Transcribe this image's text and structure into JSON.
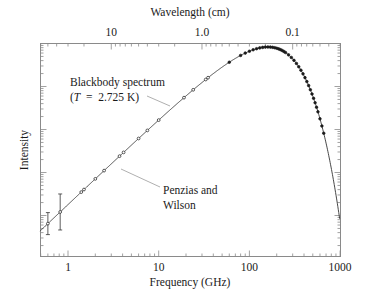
{
  "chart_data": {
    "type": "line",
    "title": "",
    "xlabel": "Frequency (GHz)",
    "ylabel": "Intensity",
    "x2label": "Wavelength (cm)",
    "xscale": "log",
    "yscale": "log",
    "xlim": [
      0.49,
      1000
    ],
    "x_ticks": [
      {
        "value": 1,
        "label": "1"
      },
      {
        "value": 10,
        "label": "10"
      },
      {
        "value": 100,
        "label": "100"
      },
      {
        "value": 1000,
        "label": "1000"
      }
    ],
    "x2_ticks": [
      {
        "value_cm": 10,
        "label": "10"
      },
      {
        "value_cm": 1.0,
        "label": "1.0"
      },
      {
        "value_cm": 0.1,
        "label": "0.1"
      }
    ],
    "y_tick_labels": [],
    "grid": false,
    "legend": null,
    "series": [
      {
        "name": "Blackbody spectrum (T = 2.725 K)",
        "kind": "curve",
        "temperature_K": 2.725
      },
      {
        "name": "Measurements",
        "kind": "points",
        "points": [
          {
            "x": 0.6,
            "err": true
          },
          {
            "x": 0.82,
            "err": true
          },
          {
            "x": 1.4
          },
          {
            "x": 1.5
          },
          {
            "x": 2.0
          },
          {
            "x": 2.5
          },
          {
            "x": 3.7
          },
          {
            "x": 4.1
          },
          {
            "x": 6.0
          },
          {
            "x": 7.5
          },
          {
            "x": 10.0
          },
          {
            "x": 19.0
          },
          {
            "x": 24.0
          },
          {
            "x": 33.0
          },
          {
            "x": 35.0
          },
          {
            "x": 60.0
          },
          {
            "x": 80.0
          },
          {
            "x": 90.0
          },
          {
            "x": 100.0
          },
          {
            "x": 110.0
          },
          {
            "x": 120.0
          },
          {
            "x": 130.0
          },
          {
            "x": 140.0
          },
          {
            "x": 150.0
          },
          {
            "x": 160.0
          },
          {
            "x": 170.0
          },
          {
            "x": 180.0
          },
          {
            "x": 190.0
          },
          {
            "x": 200.0
          },
          {
            "x": 210.0
          },
          {
            "x": 220.0
          },
          {
            "x": 230.0
          },
          {
            "x": 240.0
          },
          {
            "x": 250.0
          },
          {
            "x": 270.0
          },
          {
            "x": 290.0
          },
          {
            "x": 310.0
          },
          {
            "x": 330.0
          },
          {
            "x": 350.0
          },
          {
            "x": 370.0
          },
          {
            "x": 390.0
          },
          {
            "x": 410.0
          },
          {
            "x": 430.0
          },
          {
            "x": 450.0
          },
          {
            "x": 470.0
          },
          {
            "x": 490.0
          },
          {
            "x": 510.0
          },
          {
            "x": 530.0
          },
          {
            "x": 550.0
          },
          {
            "x": 570.0
          },
          {
            "x": 600.0
          },
          {
            "x": 630.0
          },
          {
            "x": 660.0
          }
        ]
      }
    ],
    "annotations": [
      {
        "text_line1": "Blackbody spectrum",
        "text_line2": "(T  =  2.725 K)",
        "points_to_GHz": 22
      },
      {
        "text_line1": "Penzias and",
        "text_line2": "Wilson",
        "points_to_GHz": 4.1
      }
    ]
  },
  "labels": {
    "top_axis_title": "Wavelength (cm)",
    "bottom_axis_title": "Frequency (GHz)",
    "left_axis_title": "Intensity",
    "annotation_blackbody_line1": "Blackbody spectrum",
    "annotation_blackbody_T": "T",
    "annotation_blackbody_line2_rest": "  =  2.725 K)",
    "annotation_blackbody_open": "(",
    "annotation_pw_line1": "Penzias and",
    "annotation_pw_line2": "Wilson"
  },
  "colors": {
    "axis": "#8a8a8a",
    "curve": "#333333",
    "points": "#1a1a1a",
    "text": "#1a1a1a",
    "leader": "#9a9a9a"
  }
}
